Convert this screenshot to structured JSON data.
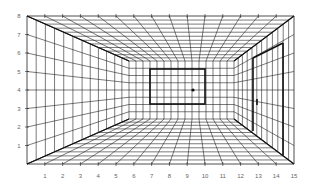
{
  "diagram": {
    "outer_rect": {
      "x1": 27,
      "y1": 16,
      "x2": 294,
      "y2": 164
    },
    "back_wall": {
      "x1": 129,
      "y1": 61,
      "x2": 234,
      "y2": 119
    },
    "vanishing_point": {
      "x": 193,
      "y": 90
    },
    "columns": 15,
    "rows": 8,
    "depth_steps": [
      0.09,
      0.18,
      0.27,
      0.36,
      0.45,
      0.54,
      0.62,
      0.7,
      0.78,
      0.86,
      0.93
    ],
    "x_axis_labels": [
      "1",
      "2",
      "3",
      "4",
      "5",
      "6",
      "7",
      "8",
      "9",
      "10",
      "11",
      "12",
      "13",
      "14",
      "15"
    ],
    "y_axis_labels": [
      "1",
      "2",
      "3",
      "4",
      "5",
      "6",
      "7",
      "8"
    ],
    "window": {
      "x1": 150,
      "y1": 69,
      "x2": 205,
      "y2": 104
    },
    "door": {
      "left_top": [
        253,
        58
      ],
      "left_bottom": [
        253,
        131
      ],
      "right_top": [
        283,
        43
      ],
      "right_bottom": [
        283,
        155
      ]
    },
    "door_handle": {
      "x": 257,
      "y1": 99,
      "y2": 105
    },
    "colors": {
      "line": "#222222",
      "heavy": "#111111",
      "label": "#666666"
    }
  }
}
